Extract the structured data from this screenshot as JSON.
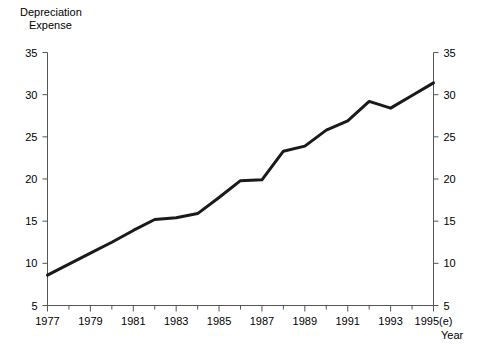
{
  "chart_data": {
    "type": "line",
    "title": "",
    "ylabel": "Depreciation Expense",
    "ylabel_line1": "Depreciation",
    "ylabel_line2": "Expense",
    "xlabel": "Year",
    "x": [
      1977,
      1978,
      1979,
      1980,
      1981,
      1982,
      1983,
      1984,
      1985,
      1986,
      1987,
      1988,
      1989,
      1990,
      1991,
      1992,
      1993,
      1994,
      1995
    ],
    "x_tick_labels": [
      "1977",
      "1979",
      "1981",
      "1983",
      "1985",
      "1987",
      "1989",
      "1991",
      "1993",
      "1995(e)"
    ],
    "x_tick_values": [
      1977,
      1979,
      1981,
      1983,
      1985,
      1987,
      1989,
      1991,
      1993,
      1995
    ],
    "minor_x_ticks": [
      1978,
      1980,
      1982,
      1984,
      1986,
      1988,
      1990,
      1992,
      1994
    ],
    "values": [
      8.6,
      9.9,
      11.2,
      12.5,
      13.9,
      15.2,
      15.4,
      15.9,
      17.8,
      19.8,
      19.9,
      23.3,
      23.9,
      25.8,
      26.9,
      29.2,
      28.4,
      29.9,
      31.4
    ],
    "y_tick_labels": [
      "5",
      "10",
      "15",
      "20",
      "25",
      "30",
      "35"
    ],
    "y_tick_values": [
      5,
      10,
      15,
      20,
      25,
      30,
      35
    ],
    "ylim": [
      5,
      35
    ],
    "xlim": [
      1977,
      1995
    ],
    "right_axis": true,
    "right_y_tick_labels": [
      "5",
      "10",
      "15",
      "20",
      "25",
      "30",
      "35"
    ],
    "grid": false,
    "legend": "none",
    "line_color": "#1a1a1a",
    "line_width": 3,
    "axis_color": "#555555",
    "background": "#ffffff"
  }
}
